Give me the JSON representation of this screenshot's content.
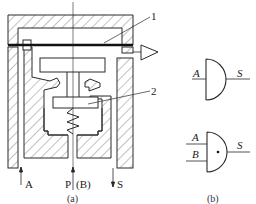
{
  "figure_a": {
    "caption": "(a)",
    "callouts": {
      "one": "1",
      "two": "2"
    },
    "ports": {
      "a": "A",
      "p": "P",
      "b": "(B)",
      "s": "S"
    }
  },
  "figure_b": {
    "caption": "(b)",
    "gate_top": {
      "input": "A",
      "output": "S"
    },
    "gate_bottom": {
      "input_1": "A",
      "input_2": "B",
      "output": "S"
    }
  },
  "colors": {
    "line": "#2a2a2a",
    "hatch": "#555555",
    "background": "#ffffff"
  }
}
